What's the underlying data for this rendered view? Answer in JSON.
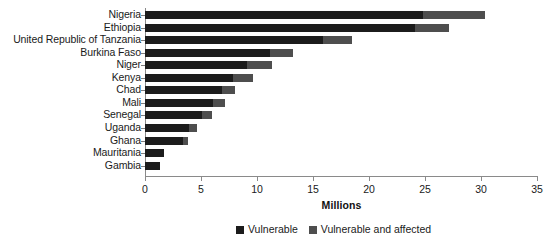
{
  "chart_data": {
    "type": "bar",
    "orientation": "horizontal",
    "stacked": true,
    "title": "",
    "xlabel": "Millions",
    "ylabel": "",
    "xlim": [
      0,
      35
    ],
    "xticks": [
      0,
      5,
      10,
      15,
      20,
      25,
      30,
      35
    ],
    "xtick_labels": [
      "0",
      "5",
      "10",
      "15",
      "20",
      "25",
      "30",
      "35"
    ],
    "grid": false,
    "legend_position": "bottom-center",
    "categories": [
      "Nigeria",
      "Ethiopia",
      "United Republic of Tanzania",
      "Burkina Faso",
      "Niger",
      "Kenya",
      "Chad",
      "Mali",
      "Senegal",
      "Uganda",
      "Ghana",
      "Mauritania",
      "Gambia"
    ],
    "series": [
      {
        "name": "Vulnerable",
        "color": "#1c1c1c",
        "values": [
          24.8,
          24.1,
          15.9,
          11.2,
          9.1,
          7.9,
          6.9,
          6.1,
          5.1,
          3.9,
          3.4,
          1.7,
          1.3
        ]
      },
      {
        "name": "Vulnerable and affected",
        "color": "#4e4e4e",
        "values": [
          5.6,
          3.0,
          2.6,
          2.0,
          2.2,
          1.7,
          1.1,
          1.0,
          0.9,
          0.7,
          0.4,
          0.0,
          0.0
        ]
      }
    ],
    "totals": [
      30.4,
      27.1,
      18.5,
      13.2,
      11.3,
      9.6,
      8.0,
      7.1,
      6.0,
      4.6,
      3.8,
      1.7,
      1.3
    ],
    "legend": [
      {
        "label": "Vulnerable",
        "color": "#1c1c1c"
      },
      {
        "label": "Vulnerable and affected",
        "color": "#4e4e4e"
      }
    ]
  },
  "colors": {
    "background": "#ffffff",
    "axis": "#8a8a8a",
    "text": "#1a1a1a",
    "series_vulnerable": "#1c1c1c",
    "series_vulnerable_affected": "#4e4e4e"
  }
}
